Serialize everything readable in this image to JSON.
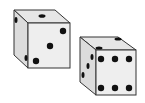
{
  "scene": {
    "description": "Two white dice with black pips",
    "background": "#ffffff",
    "face_colors": {
      "top": "#e6e6e6",
      "front": "#eeeeee",
      "left": "#dcdcdc"
    },
    "edge_color": "#333333",
    "pip_color": "#111111"
  },
  "dice": [
    {
      "name": "die-left",
      "top_face": 1,
      "front_face": 3,
      "left_face_visible_pips": 2
    },
    {
      "name": "die-right",
      "top_face": 2,
      "front_face": 6,
      "left_face_visible_pips": 2
    }
  ]
}
